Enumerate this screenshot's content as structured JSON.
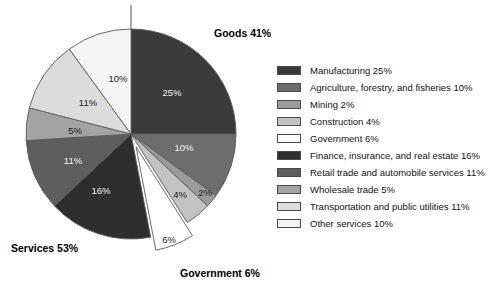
{
  "chart_data": {
    "type": "pie",
    "title": "",
    "categories": [
      "Manufacturing",
      "Agriculture, forestry, and fisheries",
      "Mining",
      "Construction",
      "Government",
      "Finance, insurance, and real estate",
      "Retail trade and automobile services",
      "Wholesale trade",
      "Transportation and public utilities",
      "Other services"
    ],
    "values": [
      25,
      10,
      2,
      4,
      6,
      16,
      11,
      5,
      11,
      10
    ],
    "slice_labels": [
      "25%",
      "10%",
      "2%",
      "4%",
      "6%",
      "16%",
      "11%",
      "5%",
      "11%",
      "10%"
    ],
    "colors": [
      "#3a3a3a",
      "#6d6d6d",
      "#9b9b9b",
      "#c2c2c2",
      "#ffffff",
      "#2e2e2e",
      "#5e5e5e",
      "#a3a3a3",
      "#dcdcdc",
      "#f4f4f4"
    ],
    "exploded": [
      "Government"
    ],
    "legend_position": "right",
    "grid": false,
    "group_annotations": [
      {
        "label": "Goods 41%",
        "value": 41
      },
      {
        "label": "Services 53%",
        "value": 53
      },
      {
        "label": "Government 6%",
        "value": 6
      }
    ]
  },
  "legend": {
    "items": [
      {
        "label": "Manufacturing 25%",
        "color": "#3a3a3a",
        "swatch": "swatch-manufacturing"
      },
      {
        "label": "Agriculture, forestry, and fisheries 10%",
        "color": "#6d6d6d",
        "swatch": "swatch-agriculture"
      },
      {
        "label": "Mining 2%",
        "color": "#9b9b9b",
        "swatch": "swatch-mining"
      },
      {
        "label": "Construction 4%",
        "color": "#c2c2c2",
        "swatch": "swatch-construction"
      },
      {
        "label": "Government 6%",
        "color": "#ffffff",
        "swatch": "swatch-government"
      },
      {
        "label": "Finance, insurance, and real estate 16%",
        "color": "#2e2e2e",
        "swatch": "swatch-finance"
      },
      {
        "label": "Retail trade and automobile services 11%",
        "color": "#5e5e5e",
        "swatch": "swatch-retail"
      },
      {
        "label": "Wholesale trade 5%",
        "color": "#a3a3a3",
        "swatch": "swatch-wholesale"
      },
      {
        "label": "Transportation and public utilities 11%",
        "color": "#dcdcdc",
        "swatch": "swatch-transportation"
      },
      {
        "label": "Other services  10%",
        "color": "#f4f4f4",
        "swatch": "swatch-other-services"
      }
    ]
  },
  "annotations": {
    "goods": "Goods 41%",
    "services": "Services 53%",
    "government": "Government 6%"
  },
  "slice_text": {
    "manufacturing": "25%",
    "agriculture": "10%",
    "mining": "2%",
    "construction": "4%",
    "government": "6%",
    "finance": "16%",
    "retail": "11%",
    "wholesale": "5%",
    "transportation": "11%",
    "other_services": "10%"
  }
}
